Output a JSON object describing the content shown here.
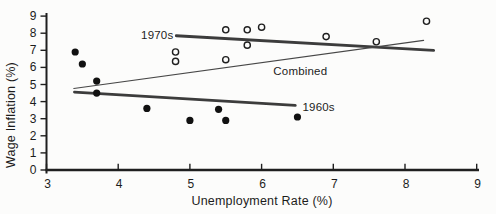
{
  "figure": {
    "background": "#fcfcfb",
    "ink_color": "#1f1f1f",
    "trend_thick_color": "#3c3c3c",
    "trend_thin_color": "#474747",
    "point_color": "#111111",
    "open_point_fill": "#fcfcfb"
  },
  "chart_data": {
    "type": "scatter",
    "title": "",
    "xlabel": "Unemployment Rate (%)",
    "ylabel": "Wage Inflation (%)",
    "xlim": [
      3,
      9
    ],
    "ylim": [
      0,
      9
    ],
    "x_ticks": [
      3,
      4,
      5,
      6,
      7,
      8,
      9
    ],
    "y_ticks": [
      0,
      1,
      2,
      3,
      4,
      5,
      6,
      7,
      8,
      9
    ],
    "grid": false,
    "legend_position": "inline-annotations",
    "series": [
      {
        "name": "1960s",
        "marker": "filled-circle",
        "points": [
          [
            3.4,
            6.9
          ],
          [
            3.5,
            6.2
          ],
          [
            3.7,
            5.2
          ],
          [
            3.7,
            4.5
          ],
          [
            4.4,
            3.6
          ],
          [
            5.0,
            2.9
          ],
          [
            5.4,
            3.55
          ],
          [
            5.5,
            2.9
          ],
          [
            6.5,
            3.1
          ]
        ]
      },
      {
        "name": "1970s",
        "marker": "open-circle",
        "points": [
          [
            4.8,
            6.9
          ],
          [
            4.8,
            6.35
          ],
          [
            5.5,
            8.2
          ],
          [
            5.5,
            6.45
          ],
          [
            5.8,
            8.2
          ],
          [
            5.8,
            7.3
          ],
          [
            6.0,
            8.35
          ],
          [
            6.9,
            7.8
          ],
          [
            7.6,
            7.5
          ],
          [
            8.3,
            8.7
          ]
        ]
      }
    ],
    "trend_lines": [
      {
        "name": "1970s",
        "from": [
          4.81,
          7.85
        ],
        "to": [
          8.4,
          7.0
        ],
        "style": "thick"
      },
      {
        "name": "1960s",
        "from": [
          3.39,
          4.55
        ],
        "to": [
          6.47,
          3.78
        ],
        "style": "thick"
      },
      {
        "name": "Combined",
        "from": [
          3.38,
          4.77
        ],
        "to": [
          8.26,
          7.58
        ],
        "style": "thin"
      }
    ],
    "annotations": [
      {
        "text": "1970s",
        "x": 4.77,
        "y": 7.66,
        "anchor": "end"
      },
      {
        "text": "Combined",
        "x": 6.54,
        "y": 5.58,
        "anchor": "middle"
      },
      {
        "text": "1960s",
        "x": 6.57,
        "y": 3.45,
        "anchor": "start"
      }
    ]
  }
}
